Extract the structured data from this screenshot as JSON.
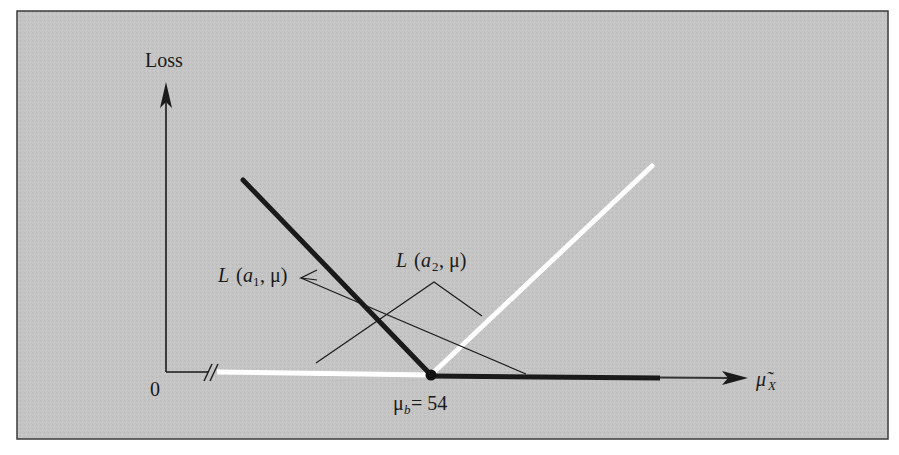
{
  "figure": {
    "type": "loss-function-diagram",
    "background_color": "#c4c4c4",
    "frame_color": "#3a3a3a",
    "y_axis": {
      "label": "Loss"
    },
    "x_axis": {
      "label_base": "μ̃",
      "label_sub": "X",
      "origin_label": "0",
      "axis_break": "//"
    },
    "point": {
      "label_base": "μ",
      "label_sub": "b",
      "label_rest": " = 54",
      "value": 54
    },
    "series": [
      {
        "name": "L (a1, μ)",
        "label_prefix": "L (",
        "label_var": "a",
        "label_sub": "1",
        "label_suffix": ", μ)",
        "color": "#1a1a1a",
        "style": "thick-black",
        "shape": "decreasing until μb, then zero"
      },
      {
        "name": "L (a2, μ)",
        "label_prefix": "L (",
        "label_var": "a",
        "label_sub": "2",
        "label_suffix": ", μ)",
        "color": "#ffffff",
        "style": "thick-white",
        "shape": "zero until μb, then increasing"
      }
    ]
  }
}
